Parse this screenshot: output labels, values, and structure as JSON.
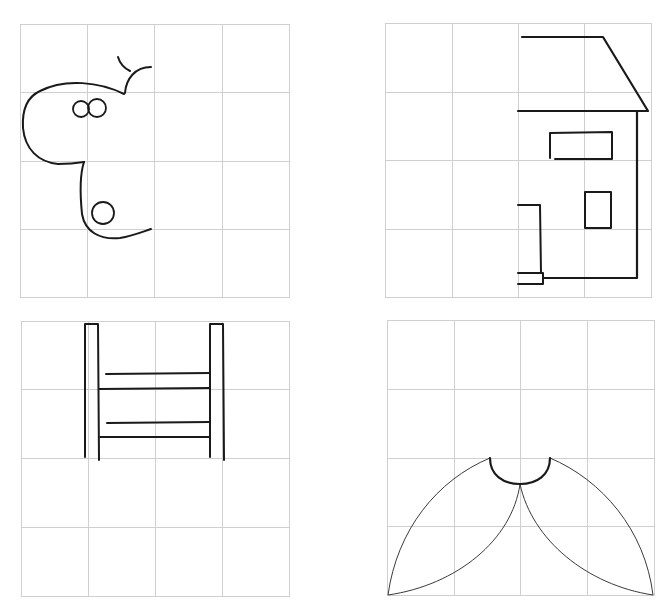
{
  "layout": {
    "grid_rows": 4,
    "grid_cols": 4,
    "grid_color": "#cfcfcf",
    "ink_color": "#1a1a1a"
  },
  "panels": [
    {
      "id": "top-left",
      "subject": "partial butterfly / bow shape (half-drawing to be completed by symmetry)",
      "bounds": {
        "x": 20,
        "y": 24,
        "width": 269,
        "height": 274
      }
    },
    {
      "id": "top-right",
      "subject": "partial house (half-drawing to be completed by symmetry)",
      "bounds": {
        "x": 385,
        "y": 23,
        "width": 266,
        "height": 275
      }
    },
    {
      "id": "bottom-left",
      "subject": "ladder / chair back outline",
      "bounds": {
        "x": 21,
        "y": 321,
        "width": 268,
        "height": 276
      }
    },
    {
      "id": "bottom-right",
      "subject": "two petal / leaf shapes joined by a semicircle",
      "bounds": {
        "x": 387,
        "y": 320,
        "width": 267,
        "height": 276
      }
    }
  ]
}
